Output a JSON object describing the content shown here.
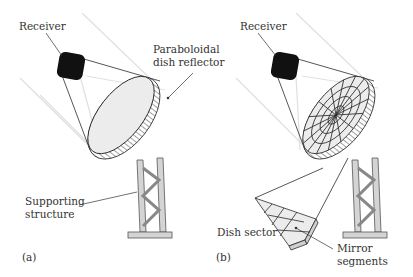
{
  "figure": {
    "panels": [
      {
        "id": "a",
        "caption": "(a)",
        "labels": {
          "receiver": "Receiver",
          "reflector_line1": "Paraboloidal",
          "reflector_line2": "dish reflector",
          "structure_line1": "Supporting",
          "structure_line2": "structure"
        }
      },
      {
        "id": "b",
        "caption": "(b)",
        "labels": {
          "receiver": "Receiver",
          "sector": "Dish sector",
          "mirror_line1": "Mirror",
          "mirror_line2": "segments"
        }
      }
    ]
  },
  "colors": {
    "line": "#2b2b2b",
    "dish_fill": "#ececec",
    "rays": "#dcdcdc",
    "receiver": "#111111",
    "tower": "#d4d4d4"
  }
}
